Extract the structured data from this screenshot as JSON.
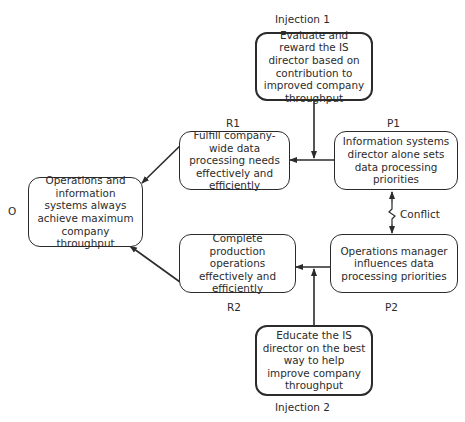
{
  "diagram": {
    "labels": {
      "injection1": "Injection 1",
      "injection2": "Injection 2",
      "r1": "R1",
      "r2": "R2",
      "p1": "P1",
      "p2": "P2",
      "o": "O",
      "conflict": "Conflict"
    },
    "nodes": {
      "injection1": "Evaluate and reward the IS director based on contribution to improved company throughput",
      "r1": "Fulfill company-wide data processing needs effectively and efficiently",
      "p1": "Information systems director alone sets data processing priorities",
      "o": "Operations and information systems always achieve maximum company throughput",
      "r2": "Complete production operations effectively and efficiently",
      "p2": "Operations manager influences data processing priorities",
      "injection2": "Educate the IS director on the best way to help improve company throughput"
    },
    "edges": [
      {
        "from": "injection1",
        "to": "p1-r1-link"
      },
      {
        "from": "p1",
        "to": "r1"
      },
      {
        "from": "r1",
        "to": "o"
      },
      {
        "from": "p2",
        "to": "r2"
      },
      {
        "from": "injection2",
        "to": "p2-r2-link"
      },
      {
        "from": "r2",
        "to": "o"
      },
      {
        "from": "p1",
        "to": "p2",
        "type": "conflict"
      }
    ]
  }
}
